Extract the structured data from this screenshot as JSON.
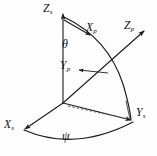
{
  "figure": {
    "kind": "3d-spherical-coordinate-axes-diagram",
    "background_color": "#fdfdfd",
    "line_color": "#1b1b1b",
    "origin_label": ""
  },
  "axes": [
    {
      "id": "zs",
      "symbol": "Z",
      "subscript": "s",
      "name": "z-axis-ship-frame",
      "direction": "up"
    },
    {
      "id": "xs",
      "symbol": "X",
      "subscript": "s",
      "name": "x-axis-ship-frame",
      "direction": "down-left"
    },
    {
      "id": "ys",
      "symbol": "Y",
      "subscript": "s",
      "name": "y-axis-ship-frame",
      "direction": "down-right"
    },
    {
      "id": "xp",
      "symbol": "X",
      "subscript": "p",
      "name": "x-axis-platform-frame",
      "direction": "down-right-tangent"
    },
    {
      "id": "yp",
      "symbol": "Y",
      "subscript": "p",
      "name": "y-axis-platform-frame",
      "direction": "leader-to-point"
    },
    {
      "id": "zp",
      "symbol": "Z",
      "subscript": "p",
      "name": "z-axis-platform-frame",
      "direction": "up-right-radial"
    }
  ],
  "angles": [
    {
      "id": "theta",
      "glyph": "θ",
      "name": "polar-angle-theta",
      "between": "Zs-and-Zp"
    },
    {
      "id": "psi",
      "glyph": "ψ",
      "name": "azimuth-angle-psi",
      "between": "Xs-and-Ys"
    }
  ],
  "labels": {
    "zs": "Z",
    "zs_sub": "s",
    "xp": "X",
    "xp_sub": "p",
    "zp": "Z",
    "zp_sub": "p",
    "yp": "Y",
    "yp_sub": "p",
    "ys": "Y",
    "ys_sub": "s",
    "xs": "X",
    "xs_sub": "s",
    "theta": "θ",
    "psi": "ψ"
  }
}
